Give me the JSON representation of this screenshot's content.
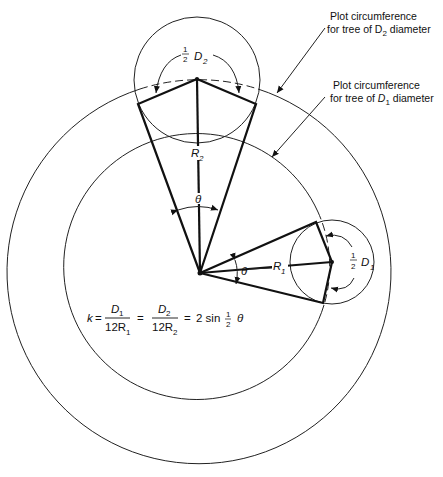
{
  "figure": {
    "callouts": [
      {
        "line1": "Plot circumference",
        "line2_prefix": "for tree of D",
        "line2_sub": "2",
        "line2_suffix": " diameter"
      },
      {
        "line1": "Plot circumference",
        "line2_prefix": "for tree of ",
        "line2_var": "D",
        "line2_sub": "1",
        "line2_suffix": " diameter"
      }
    ],
    "labels": {
      "half_num": "1",
      "half_den": "2",
      "D": "D",
      "R": "R",
      "sub1": "1",
      "sub2": "2",
      "theta": "θ"
    },
    "formula": {
      "k": "k",
      "eq": "=",
      "num1": "D",
      "num1_sub": "1",
      "den1": "12R",
      "den1_sub": "1",
      "num2": "D",
      "num2_sub": "2",
      "den2": "12R",
      "den2_sub": "2",
      "rhs": "2 sin",
      "half_num": "1",
      "half_den": "2",
      "theta": "θ"
    }
  }
}
